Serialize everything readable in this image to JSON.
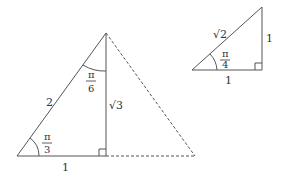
{
  "figure": {
    "type": "special right triangles",
    "stroke_color": "#555555",
    "triangle_30_60_90": {
      "hypotenuse_label": "2",
      "base_label": "1",
      "height_label": "√3",
      "bottom_angle": {
        "numerator": "π",
        "denominator": "3"
      },
      "top_angle": {
        "numerator": "π",
        "denominator": "6"
      },
      "right_angle_marker": true,
      "dashed_mirror": true
    },
    "triangle_45_45_90": {
      "hypotenuse_label": "√2",
      "base_label": "1",
      "height_label": "1",
      "angle": {
        "numerator": "π",
        "denominator": "4"
      },
      "right_angle_marker": true
    }
  }
}
